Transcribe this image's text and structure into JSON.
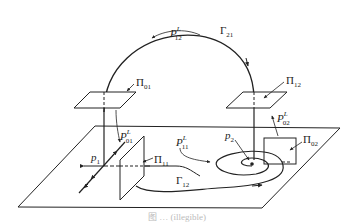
{
  "diagram": {
    "labels": {
      "gamma21": {
        "main": "Γ",
        "sub": "21"
      },
      "p12": {
        "main": "P",
        "sub": "12",
        "sup": "L"
      },
      "pi01": {
        "main": "Π",
        "sub": "01"
      },
      "pi12": {
        "main": "Π",
        "sub": "12"
      },
      "p01": {
        "main": "P",
        "sub": "01",
        "sup": "L"
      },
      "p02": {
        "main": "P",
        "sub": "02",
        "sup": "L"
      },
      "p1": {
        "main": "p",
        "sub": "1"
      },
      "pi11": {
        "main": "Π",
        "sub": "11"
      },
      "p11": {
        "main": "P",
        "sub": "11",
        "sup": "L"
      },
      "p2": {
        "main": "p",
        "sub": "2"
      },
      "pi02": {
        "main": "Π",
        "sub": "02"
      },
      "gamma12": {
        "main": "Γ",
        "sub": "12"
      }
    },
    "caption": "图 … (illegible)"
  },
  "colors": {
    "stroke": "#222222",
    "background": "#ffffff"
  }
}
